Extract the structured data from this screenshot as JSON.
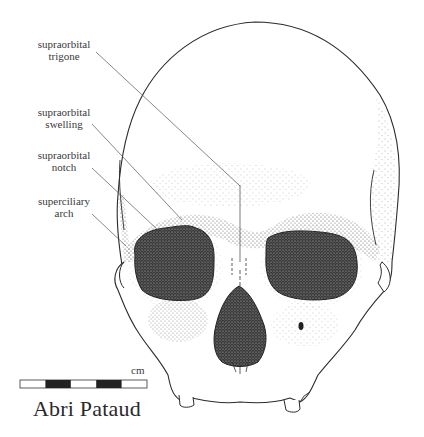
{
  "figure": {
    "caption": "Abri Pataud"
  },
  "labels": [
    {
      "line1": "supraorbital",
      "line2": "trigone"
    },
    {
      "line1": "supraorbital",
      "line2": "swelling"
    },
    {
      "line1": "supraorbital",
      "line2": "notch"
    },
    {
      "line1": "superciliary",
      "line2": "arch"
    }
  ],
  "scale_bar": {
    "unit": "cm",
    "segments": [
      "white",
      "black",
      "white",
      "black",
      "white"
    ]
  },
  "colors": {
    "ink": "#2b2b2b",
    "background": "#ffffff"
  }
}
